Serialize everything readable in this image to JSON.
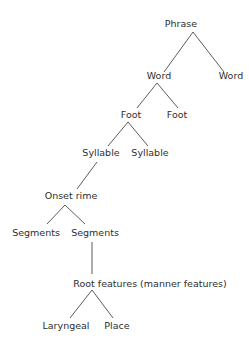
{
  "diagram": {
    "type": "tree",
    "colors": {
      "text": "#2e2e2e",
      "edge": "#4a4a4a",
      "background": "#ffffff"
    },
    "nodes": [
      {
        "id": "phrase",
        "label": "Phrase",
        "x": 181,
        "y": 27
      },
      {
        "id": "word1",
        "label": "Word",
        "x": 159,
        "y": 79
      },
      {
        "id": "word2",
        "label": "Word",
        "x": 231,
        "y": 79
      },
      {
        "id": "foot1",
        "label": "Foot",
        "x": 131,
        "y": 118
      },
      {
        "id": "foot2",
        "label": "Foot",
        "x": 177,
        "y": 118
      },
      {
        "id": "syllable1",
        "label": "Syllable",
        "x": 101,
        "y": 156
      },
      {
        "id": "syllable2",
        "label": "Syllable",
        "x": 150,
        "y": 156
      },
      {
        "id": "onsetrime",
        "label": "Onset rime",
        "x": 71,
        "y": 199
      },
      {
        "id": "segments1",
        "label": "Segments",
        "x": 36,
        "y": 236
      },
      {
        "id": "segments2",
        "label": "Segments",
        "x": 95,
        "y": 236
      },
      {
        "id": "root",
        "label": "Root features (manner features)",
        "x": 150,
        "y": 287
      },
      {
        "id": "laryngeal",
        "label": "Laryngeal",
        "x": 66,
        "y": 329
      },
      {
        "id": "place",
        "label": "Place",
        "x": 117,
        "y": 329
      }
    ],
    "edges": [
      {
        "from": "phrase",
        "to": "word1",
        "x1": 193,
        "y1": 32,
        "x2": 164,
        "y2": 72
      },
      {
        "from": "phrase",
        "to": "word2",
        "x1": 193,
        "y1": 32,
        "x2": 224,
        "y2": 72
      },
      {
        "from": "word1",
        "to": "foot1",
        "x1": 157,
        "y1": 83,
        "x2": 137,
        "y2": 108
      },
      {
        "from": "word1",
        "to": "foot2",
        "x1": 157,
        "y1": 83,
        "x2": 178,
        "y2": 108
      },
      {
        "from": "foot1",
        "to": "syllable1",
        "x1": 128,
        "y1": 122,
        "x2": 108,
        "y2": 146
      },
      {
        "from": "foot1",
        "to": "syllable2",
        "x1": 128,
        "y1": 122,
        "x2": 148,
        "y2": 146
      },
      {
        "from": "syllable1",
        "to": "onsetrime",
        "x1": 97,
        "y1": 162,
        "x2": 77,
        "y2": 189
      },
      {
        "from": "onsetrime",
        "to": "segments1",
        "x1": 65,
        "y1": 205,
        "x2": 47,
        "y2": 224
      },
      {
        "from": "onsetrime",
        "to": "segments2",
        "x1": 65,
        "y1": 205,
        "x2": 85,
        "y2": 224
      },
      {
        "from": "segments2",
        "to": "root",
        "x1": 92,
        "y1": 242,
        "x2": 92,
        "y2": 274
      },
      {
        "from": "root",
        "to": "laryngeal",
        "x1": 92,
        "y1": 290,
        "x2": 70,
        "y2": 318
      },
      {
        "from": "root",
        "to": "place",
        "x1": 92,
        "y1": 290,
        "x2": 113,
        "y2": 318
      }
    ]
  }
}
